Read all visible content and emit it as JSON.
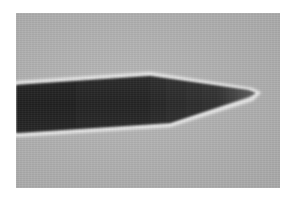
{
  "image": {
    "subject": "micrograph of a tapered needle / probe tip on a gray background",
    "colors": {
      "page_background": "#ffffff",
      "field_background": "#b3b3b3",
      "needle_body": "#2a2a2a",
      "needle_tip": "#555555",
      "edge_halo": "#e6e6e6"
    },
    "frame": {
      "x": 16,
      "y": 13,
      "width": 264,
      "height": 175
    },
    "needle": {
      "left_top_y": 85,
      "left_bottom_y": 133,
      "shoulder_top": {
        "x": 150,
        "y": 76
      },
      "shoulder_bottom": {
        "x": 170,
        "y": 123
      },
      "tip": {
        "x": 255,
        "y": 93
      }
    }
  }
}
